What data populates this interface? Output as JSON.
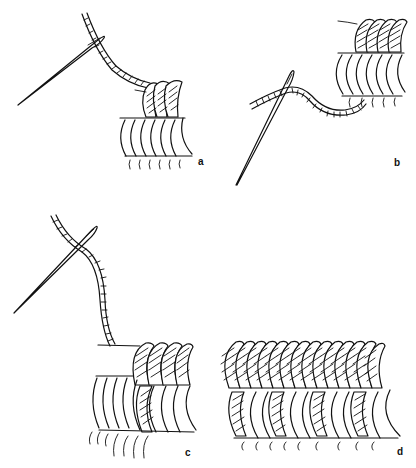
{
  "figure": {
    "title": "",
    "ink_color": "#111111",
    "background_color": "#ffffff",
    "panels": [
      {
        "id": "a",
        "label": "a",
        "content": "Needle and twisted thread; three hatched wraps over a row of seven white crescent coils with fringe below"
      },
      {
        "id": "b",
        "label": "b",
        "content": "Needle passing behind work; wavy twisted thread; row of hatched wraps above a row of white coils"
      },
      {
        "id": "c",
        "label": "c",
        "content": "Needle and thread rising from work; hatched wraps on an upper core above a lower row of coils, one coil hatched"
      },
      {
        "id": "d",
        "label": "d",
        "content": "Completed band: continuous row of hatched wraps above a lower row of coils with alternating hatched coils, fringe below"
      }
    ]
  }
}
